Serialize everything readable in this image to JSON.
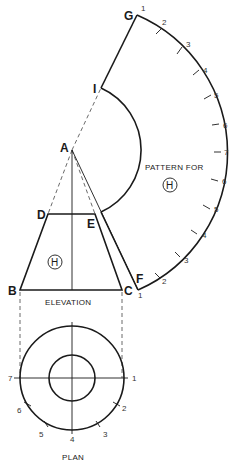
{
  "diagram": {
    "type": "development of frustum of a cone (radial line development)",
    "vertices": {
      "apex": "A",
      "elevation_top_left": "D",
      "elevation_top_right": "E",
      "elevation_bottom_left": "B",
      "elevation_bottom_right": "C",
      "pattern_outer_start": "G",
      "pattern_inner_start": "I",
      "pattern_outer_end": "F"
    },
    "labels": {
      "elevation": "ELEVATION",
      "plan": "PLAN",
      "pattern_for": "PATTERN FOR",
      "part_symbol": "H"
    },
    "pattern_arc_numbers": [
      "1",
      "2",
      "3",
      "4",
      "5",
      "6",
      "7",
      "6",
      "5",
      "4",
      "3",
      "2",
      "1"
    ],
    "plan_numbers": [
      "1",
      "2",
      "3",
      "4",
      "5",
      "6",
      "7"
    ],
    "colors": {
      "line": "#1a1a1a",
      "background": "#ffffff"
    }
  }
}
